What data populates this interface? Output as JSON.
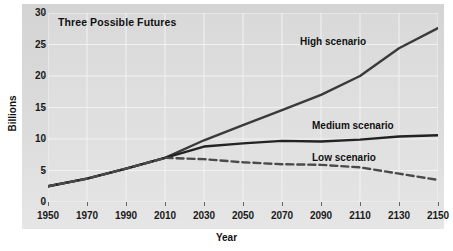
{
  "chart_data": {
    "type": "line",
    "title": "Three Possible Futures",
    "xlabel": "Year",
    "ylabel": "Billions",
    "xlim": [
      1950,
      2150
    ],
    "ylim": [
      0,
      30
    ],
    "grid": true,
    "legend_position": "inline-annotations",
    "xticks": [
      1950,
      1970,
      1990,
      2010,
      2030,
      2050,
      2070,
      2090,
      2110,
      2130,
      2150
    ],
    "yticks": [
      0,
      5,
      10,
      15,
      20,
      25,
      30
    ],
    "x": [
      1950,
      1970,
      1990,
      2010,
      2030,
      2050,
      2070,
      2090,
      2110,
      2130,
      2150
    ],
    "series": [
      {
        "name": "High scenario",
        "style": "solid",
        "color": "#3a3a3a",
        "values": [
          2.5,
          3.7,
          5.3,
          7.0,
          9.8,
          12.2,
          14.6,
          17.0,
          20.0,
          24.4,
          27.6
        ]
      },
      {
        "name": "Medium scenario",
        "style": "solid",
        "color": "#222222",
        "values": [
          2.5,
          3.7,
          5.3,
          7.0,
          8.8,
          9.3,
          9.7,
          9.6,
          9.9,
          10.4,
          10.6
        ]
      },
      {
        "name": "Low scenario",
        "style": "dashed",
        "color": "#4a4a4a",
        "values": [
          2.5,
          3.7,
          5.3,
          7.0,
          6.8,
          6.3,
          6.0,
          5.9,
          5.5,
          4.5,
          3.5
        ]
      }
    ],
    "annotations": [
      {
        "text": "High scenario",
        "series": "High scenario"
      },
      {
        "text": "Medium scenario",
        "series": "Medium scenario"
      },
      {
        "text": "Low scenario",
        "series": "Low scenario"
      }
    ]
  }
}
